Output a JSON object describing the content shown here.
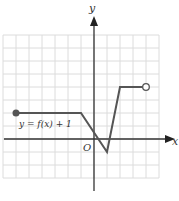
{
  "figure": {
    "axis_labels": {
      "x": "x",
      "y": "y",
      "origin": "O"
    },
    "curve_label": "y = f(x) + 1",
    "colors": {
      "grid": "#dcdcdc",
      "axis": "#333333",
      "curve": "#555555"
    }
  },
  "chart_data": {
    "type": "line",
    "title": "",
    "xlabel": "x",
    "ylabel": "y",
    "xlim": [
      -7,
      5
    ],
    "ylim": [
      -3,
      8
    ],
    "grid": true,
    "series": [
      {
        "name": "y = f(x) + 1",
        "points": [
          [
            -6,
            2
          ],
          [
            -1,
            2
          ],
          [
            1,
            -1
          ],
          [
            2,
            4
          ],
          [
            4,
            4
          ]
        ],
        "endpoints": {
          "start": {
            "x": -6,
            "y": 2,
            "type": "closed"
          },
          "end": {
            "x": 4,
            "y": 4,
            "type": "open"
          }
        }
      }
    ]
  }
}
